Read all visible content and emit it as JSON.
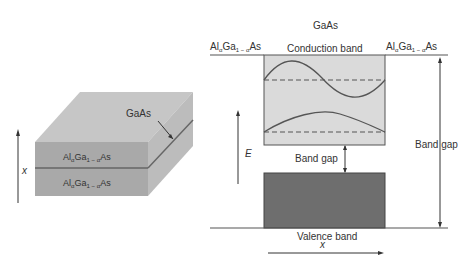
{
  "left_panel": {
    "layer_label": "GaAs",
    "top_layer": {
      "base": "Al",
      "sub1": "α",
      "mid": "Ga",
      "sub2": "1 − α",
      "end": "As"
    },
    "bottom_layer": {
      "base": "Al",
      "sub1": "α",
      "mid": "Ga",
      "sub2": "1 − α",
      "end": "As"
    },
    "axis_label": "x"
  },
  "right_panel": {
    "title": "GaAs",
    "left_material": {
      "base": "Al",
      "sub1": "α",
      "mid": "Ga",
      "sub2": "1 − α",
      "end": "As"
    },
    "right_material": {
      "base": "Al",
      "sub1": "α",
      "mid": "Ga",
      "sub2": "1 − α",
      "end": "As"
    },
    "conduction_band_label": "Conduction band",
    "valence_band_label": "Valence band",
    "inner_band_gap_label": "Band gap",
    "outer_band_gap_label": "Band gap",
    "energy_axis_label": "E",
    "position_axis_label": "x"
  },
  "colors": {
    "conduction_fill": "#d9d9d9",
    "valence_fill": "#6e6e6e",
    "line": "#555555",
    "slab_top": "#c4c4c4",
    "slab_front": "#a8a8a8",
    "slab_side": "#bdbdbd"
  }
}
